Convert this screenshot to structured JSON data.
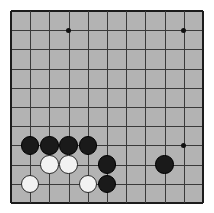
{
  "board": {
    "title": "Go board position",
    "background_color": "#b3b3b3",
    "line_color": "#3a3a3a",
    "edge_color": "#1c1c1c",
    "black_color": "#1a1a1a",
    "white_color": "#f2f2f2",
    "page_background": "#ffffff",
    "left": 11,
    "top": 11,
    "spacing": 19.2,
    "columns": 11,
    "rows": 11,
    "stone_radius": 9.2
  },
  "star_points": [
    {
      "col": 3,
      "row": 1
    },
    {
      "col": 9,
      "row": 1
    },
    {
      "col": 9,
      "row": 7
    }
  ],
  "stones": [
    {
      "col": 1,
      "row": 7,
      "color": "black"
    },
    {
      "col": 2,
      "row": 7,
      "color": "black"
    },
    {
      "col": 3,
      "row": 7,
      "color": "black"
    },
    {
      "col": 4,
      "row": 7,
      "color": "black"
    },
    {
      "col": 2,
      "row": 8,
      "color": "white"
    },
    {
      "col": 3,
      "row": 8,
      "color": "white"
    },
    {
      "col": 5,
      "row": 8,
      "color": "black"
    },
    {
      "col": 8,
      "row": 8,
      "color": "black"
    },
    {
      "col": 1,
      "row": 9,
      "color": "white"
    },
    {
      "col": 4,
      "row": 9,
      "color": "white"
    },
    {
      "col": 5,
      "row": 9,
      "color": "black"
    }
  ],
  "counts": {
    "black_stones": 7,
    "white_stones": 4,
    "total_stones": 11
  }
}
